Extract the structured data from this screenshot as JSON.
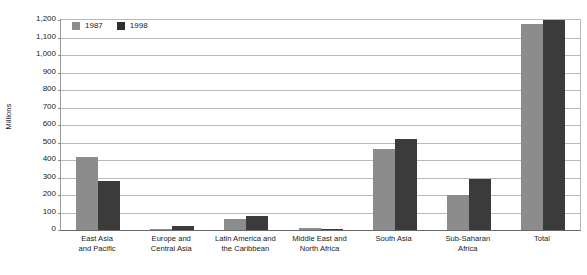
{
  "chart_data": {
    "type": "bar",
    "title": "",
    "xlabel": "",
    "ylabel": "Millions",
    "ylim": [
      0,
      1200
    ],
    "ytick_step": 100,
    "grid": true,
    "legend_position": "top-left-inside",
    "categories": [
      "East Asia and Pacific",
      "Europe and Central Asia",
      "Latin America and the Caribbean",
      "Middle East and North Africa",
      "South Asia",
      "Sub-Saharan Africa",
      "Total"
    ],
    "category_lines": [
      [
        "East Asia",
        "and Pacific"
      ],
      [
        "Europe and",
        "Central Asia"
      ],
      [
        "Latin America and",
        "the Caribbean"
      ],
      [
        "Middle East and",
        "North Africa"
      ],
      [
        "South Asia"
      ],
      [
        "Sub-Saharan",
        "Africa"
      ],
      [
        "Total"
      ]
    ],
    "ytick_labels": [
      "1,200",
      "1,100",
      "1,000",
      "900",
      "800",
      "700",
      "600",
      "500",
      "400",
      "300",
      "200",
      "100",
      "0"
    ],
    "ytick_values": [
      1200,
      1100,
      1000,
      900,
      800,
      700,
      600,
      500,
      400,
      300,
      200,
      100,
      0
    ],
    "series": [
      {
        "name": "1987",
        "color": "#8c8c8c",
        "values": [
          418,
          2,
          64,
          9,
          464,
          202,
          1175
        ]
      },
      {
        "name": "1998",
        "color": "#3b3b3b",
        "values": [
          278,
          24,
          78,
          6,
          522,
          291,
          1199
        ]
      }
    ]
  },
  "legend": {
    "items": [
      {
        "label": "1987",
        "color": "#8c8c8c"
      },
      {
        "label": "1998",
        "color": "#2e2e2e"
      }
    ]
  },
  "colors": {
    "series_1987": "#8c8c8c",
    "series_1998": "#3b3b3b",
    "gridline": "#b9b9b9",
    "axis": "#6a6a6a",
    "text": "#1a1a1a",
    "background": "#ffffff"
  }
}
